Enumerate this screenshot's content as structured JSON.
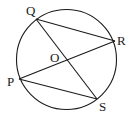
{
  "diagram": {
    "type": "circle-geometry",
    "circle": {
      "cx": 66.5,
      "cy": 59.5,
      "r": 50,
      "center_label": "O"
    },
    "points": {
      "Q": {
        "x": 36,
        "y": 19,
        "label": "Q",
        "label_x": 26,
        "label_y": 15
      },
      "R": {
        "x": 115,
        "y": 41,
        "label": "R",
        "label_x": 117,
        "label_y": 45
      },
      "P": {
        "x": 19,
        "y": 79,
        "label": "P",
        "label_x": 7,
        "label_y": 86
      },
      "S": {
        "x": 97,
        "y": 99,
        "label": "S",
        "label_x": 99,
        "label_y": 111
      },
      "O": {
        "x": 66.5,
        "y": 59.5,
        "label": "O",
        "label_x": 50,
        "label_y": 62
      }
    },
    "segments": [
      {
        "name": "QR",
        "from": "Q",
        "to": "R"
      },
      {
        "name": "QS",
        "from": "Q",
        "to": "S"
      },
      {
        "name": "PR",
        "from": "P",
        "to": "R"
      },
      {
        "name": "PS",
        "from": "P",
        "to": "S"
      }
    ],
    "stroke_color": "#1a1a1a",
    "background": "#ffffff"
  }
}
